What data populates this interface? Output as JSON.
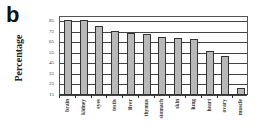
{
  "panel_label": "b",
  "chart_data": {
    "type": "bar",
    "title": "",
    "xlabel": "",
    "ylabel": "Percentage",
    "ylim": [
      15,
      85
    ],
    "yticks": [
      85,
      75,
      65,
      55,
      45,
      35,
      25,
      15
    ],
    "grid": true,
    "legend": null,
    "categories": [
      "brain",
      "kidney",
      "eyes",
      "testis",
      "liver",
      "thymus",
      "stomach",
      "skin",
      "lung",
      "heart",
      "ovary",
      "muscle"
    ],
    "values": [
      85,
      85,
      79,
      75,
      73,
      72,
      69,
      68,
      67,
      56,
      51,
      21
    ],
    "bar_color": "#b8b8b8"
  }
}
